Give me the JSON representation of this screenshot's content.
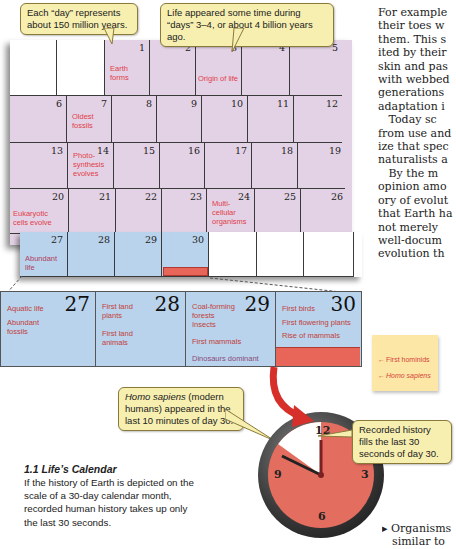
{
  "callouts": {
    "day_scale": "Each “day” represents about 150 million years.",
    "life_origin": "Life appeared some time during “days” 3–4, or about 4 billion years ago.",
    "homo_sapiens_italic": "Homo sapiens",
    "homo_sapiens_rest": " (modern humans) appeared in the last 10 minutes of day 30.",
    "recorded_history": "Recorded history fills the last 30 seconds of day 30."
  },
  "calendar": {
    "days": [
      "1",
      "2",
      "3",
      "4",
      "5",
      "6",
      "7",
      "8",
      "9",
      "10",
      "11",
      "12",
      "13",
      "14",
      "15",
      "16",
      "17",
      "18",
      "19",
      "20",
      "21",
      "22",
      "23",
      "24",
      "25",
      "26",
      "27",
      "28",
      "29",
      "30"
    ],
    "events": {
      "earth_forms": "Earth forms",
      "origin_of_life": "Origin of life",
      "oldest_fossils": "Oldest fossils",
      "photosynthesis": "Photo-synthesis evolves",
      "eukaryotic": "Eukaryotic cells evolve",
      "multicellular": "Multi-cellular organisms",
      "abundant_life": "Abundant life"
    }
  },
  "zoom_panel": {
    "days": [
      {
        "num": "27",
        "events": [
          "Aquatic life",
          "Abundant fossils"
        ]
      },
      {
        "num": "28",
        "events": [
          "First land plants",
          "First land animals"
        ]
      },
      {
        "num": "29",
        "events": [
          "Coal-forming forests",
          "Insects",
          "First mammals",
          "Dinosaurs dominant"
        ]
      },
      {
        "num": "30",
        "events": [
          "First birds",
          "First flowering plants",
          "Rise of mammals"
        ]
      }
    ]
  },
  "sticky_note": {
    "first_hominids": "First hominids",
    "homo_sapiens": "Homo sapiens"
  },
  "clock": {
    "n12": "12",
    "n3": "3",
    "n6": "6",
    "n9": "9"
  },
  "caption": {
    "title": "1.1  Life’s Calendar",
    "body": "If the history of Earth is depicted on the scale of a 30-day calendar month, recorded human history takes up only the last 30 seconds."
  },
  "body_text": {
    "lines": [
      "For example",
      "their toes w",
      "them. This s",
      "ited by their",
      "skin and pas",
      "with webbed",
      "generations",
      "adaptation i",
      "   Today sc",
      "from use and",
      "ize that spec",
      "naturalists a",
      "   By the m",
      "opinion amo",
      "ory of evolut",
      "that Earth ha",
      "not merely",
      "well-docum",
      "evolution th"
    ],
    "bullet": "▸ Organisms",
    "bullet_cont": "similar to"
  },
  "colors": {
    "calendar_pink": "#e3d2e5",
    "calendar_blue": "#b9d3ec",
    "event_red": "#e0404a",
    "callout_yellow": "#f7efb0",
    "clock_red": "#e36d5f"
  }
}
